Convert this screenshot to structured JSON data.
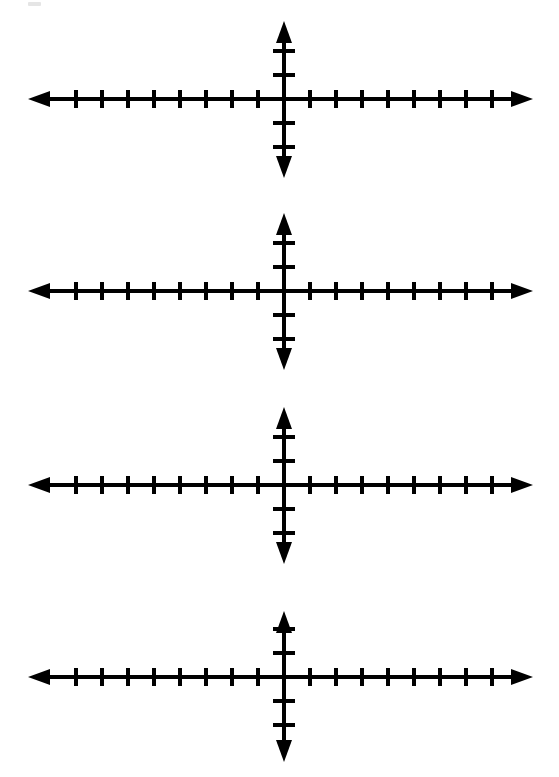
{
  "document": {
    "kind": "math-worksheet-scan",
    "title": "Blank Coordinate Grids",
    "background_color": "#ffffff",
    "ink_color": "#000000",
    "width": 559,
    "height": 777,
    "figure_count": 4
  },
  "artifact": {
    "label": "scan-speck",
    "x": 28,
    "y": 2,
    "width": 13,
    "height": 4,
    "color": "#cfcfcf"
  },
  "chart_data": [
    {
      "type": "scatter",
      "title": "Coordinate grid 1",
      "xlabel": "",
      "ylabel": "",
      "xlim": [
        -8,
        8
      ],
      "ylim": [
        -2,
        2
      ],
      "grid": false,
      "legend": null,
      "x": [],
      "y": [],
      "series": [],
      "annotations": [],
      "axes": {
        "origin_x": 284,
        "origin_y": 99,
        "x_left_end": 28,
        "x_right_end": 533,
        "y_top_end": 21,
        "y_bottom_end": 178,
        "x_ticks_left": 8,
        "x_ticks_right": 8,
        "y_ticks_up": 2,
        "y_ticks_down": 2,
        "x_tick_spacing": 26,
        "y_tick_spacing": 24,
        "x_tick_half_length": 9,
        "y_tick_half_length": 11,
        "stroke_width": 4,
        "arrowheads": [
          "left",
          "right",
          "up",
          "down"
        ],
        "tick_labels": []
      }
    },
    {
      "type": "scatter",
      "title": "Coordinate grid 2",
      "xlabel": "",
      "ylabel": "",
      "xlim": [
        -8,
        8
      ],
      "ylim": [
        -2,
        2
      ],
      "grid": false,
      "legend": null,
      "x": [],
      "y": [],
      "series": [],
      "annotations": [],
      "axes": {
        "origin_x": 284,
        "origin_y": 291,
        "x_left_end": 28,
        "x_right_end": 533,
        "y_top_end": 213,
        "y_bottom_end": 370,
        "x_ticks_left": 8,
        "x_ticks_right": 8,
        "y_ticks_up": 2,
        "y_ticks_down": 2,
        "x_tick_spacing": 26,
        "y_tick_spacing": 24,
        "x_tick_half_length": 9,
        "y_tick_half_length": 11,
        "stroke_width": 4,
        "arrowheads": [
          "left",
          "right",
          "up",
          "down"
        ],
        "tick_labels": []
      }
    },
    {
      "type": "scatter",
      "title": "Coordinate grid 3",
      "xlabel": "",
      "ylabel": "",
      "xlim": [
        -8,
        8
      ],
      "ylim": [
        -2,
        2
      ],
      "grid": false,
      "legend": null,
      "x": [],
      "y": [],
      "series": [],
      "annotations": [],
      "axes": {
        "origin_x": 284,
        "origin_y": 485,
        "x_left_end": 28,
        "x_right_end": 533,
        "y_top_end": 407,
        "y_bottom_end": 564,
        "x_ticks_left": 8,
        "x_ticks_right": 8,
        "y_ticks_up": 2,
        "y_ticks_down": 2,
        "x_tick_spacing": 26,
        "y_tick_spacing": 24,
        "x_tick_half_length": 9,
        "y_tick_half_length": 11,
        "stroke_width": 4,
        "arrowheads": [
          "left",
          "right",
          "up",
          "down"
        ],
        "tick_labels": []
      }
    },
    {
      "type": "scatter",
      "title": "Coordinate grid 4",
      "xlabel": "",
      "ylabel": "",
      "xlim": [
        -8,
        8
      ],
      "ylim": [
        -2,
        2
      ],
      "grid": false,
      "legend": null,
      "x": [],
      "y": [],
      "series": [],
      "annotations": [],
      "axes": {
        "origin_x": 284,
        "origin_y": 677,
        "x_left_end": 28,
        "x_right_end": 533,
        "y_top_end": 611,
        "y_bottom_end": 762,
        "x_ticks_left": 8,
        "x_ticks_right": 8,
        "y_ticks_up": 2,
        "y_ticks_down": 2,
        "x_tick_spacing": 26,
        "y_tick_spacing": 24,
        "x_tick_half_length": 9,
        "y_tick_half_length": 11,
        "stroke_width": 4,
        "arrowheads": [
          "left",
          "right",
          "up",
          "down"
        ],
        "tick_labels": []
      }
    }
  ]
}
